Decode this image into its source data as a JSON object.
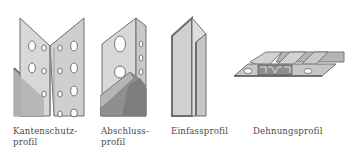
{
  "figures": [
    {
      "id": "kantenschutzprofil",
      "caption_line1": "Kantenschutz-",
      "caption_line2": "profil"
    },
    {
      "id": "abschlussprofil",
      "caption_line1": "Abschluss-",
      "caption_line2": "profil"
    },
    {
      "id": "einfassprofil",
      "caption_line1": "Einfassprofil",
      "caption_line2": ""
    },
    {
      "id": "dehnungsprofil",
      "caption_line1": "Dehnungsprofil",
      "caption_line2": ""
    }
  ],
  "colors": {
    "face_light": "#d6d6d6",
    "face_mid": "#bdbdbd",
    "face_dark": "#9a9a9a",
    "outline": "#6e6e6e",
    "text": "#4a4a4a",
    "background": "#ffffff"
  }
}
